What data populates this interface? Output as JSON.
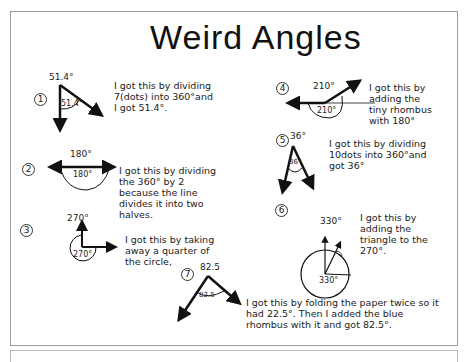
{
  "title": "Weird Angles",
  "items": [
    {
      "number": "1",
      "label_top": "51.4°",
      "label_inside": "51.4°",
      "explanation": "I got this by dividing 7(dots) into 360°and I got 51.4°."
    },
    {
      "number": "2",
      "label_top": "180°",
      "label_inside": "180°",
      "explanation": "I got this by dividing the 360° by 2 because the line divides it into two halves."
    },
    {
      "number": "3",
      "label_top": "270°",
      "label_inside": "270°",
      "explanation": "I got this by taking away a quarter of the circle,"
    },
    {
      "number": "4",
      "label_top": "210°",
      "label_inside": "210°",
      "explanation": "I got this by adding the tiny rhombus with 180°"
    },
    {
      "number": "5",
      "label_top": "36°",
      "label_inside": "36°",
      "explanation": "I got this by dividing 10dots into 360°and got 36°"
    },
    {
      "number": "6",
      "label_top": "330°",
      "label_inside": "330°",
      "explanation": "I got this by adding the triangle to the 270°."
    },
    {
      "number": "7",
      "label_top": "82.5",
      "label_inside": "82.5",
      "explanation": "I got this by folding the paper twice so it had 22.5°. Then I added the blue rhombus with it and got 82.5°."
    }
  ]
}
